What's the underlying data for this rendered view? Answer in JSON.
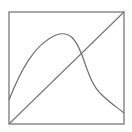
{
  "diagram": {
    "frame": {
      "x": 9,
      "y": 12,
      "width": 115,
      "height": 112,
      "stroke": "#8a8a8a",
      "stroke_width": 1.5
    },
    "diagonal_line": {
      "x1": 9,
      "y1": 124,
      "x2": 124,
      "y2": 12,
      "stroke": "#7a7a7a"
    },
    "curve": {
      "stroke": "#6f6f6f",
      "description": "skewed bell-shaped curve starting on left edge, peaking left of center, descending steeply and flattening toward right edge",
      "points": [
        [
          9,
          100
        ],
        [
          22,
          68
        ],
        [
          38,
          45
        ],
        [
          52,
          36
        ],
        [
          62,
          34
        ],
        [
          72,
          38
        ],
        [
          80,
          52
        ],
        [
          86,
          68
        ],
        [
          92,
          82
        ],
        [
          100,
          94
        ],
        [
          112,
          104
        ],
        [
          124,
          113
        ]
      ]
    },
    "intersection": {
      "x": 81,
      "y": 55
    },
    "colors": {
      "background": "#ffffff",
      "line": "#7a7a7a"
    }
  }
}
